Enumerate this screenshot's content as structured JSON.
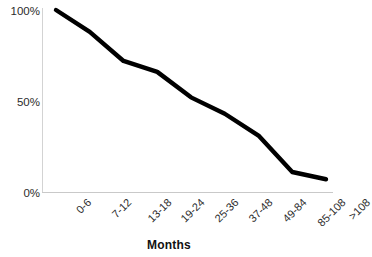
{
  "chart_data": {
    "type": "line",
    "title": "",
    "subtitle": "",
    "xlabel": "Months",
    "ylabel": "",
    "categories": [
      "0-6",
      "7-12",
      "13-18",
      "19-24",
      "25-36",
      "37-48",
      "49-84",
      "85-108",
      ">108"
    ],
    "values": [
      100,
      88,
      72,
      66,
      52,
      43,
      31,
      11,
      7
    ],
    "series": [
      {
        "name": "",
        "values": [
          100,
          88,
          72,
          66,
          52,
          43,
          31,
          11,
          7
        ]
      }
    ],
    "ylim": [
      0,
      100
    ],
    "y_ticks": [
      0,
      50,
      100
    ],
    "y_tick_labels": [
      "0%",
      "50%",
      "100%"
    ],
    "grid": false,
    "legend": false,
    "legend_position": "none",
    "line_color": "#000000",
    "axis_color": "#d0d0d0",
    "background": "#ffffff",
    "markers": false,
    "annotations": []
  },
  "axes": {
    "y_labels": [
      "100%",
      "50%",
      "0%"
    ],
    "x_labels": [
      "0-6",
      "7-12",
      "13-18",
      "19-24",
      "25-36",
      "37-48",
      "49-84",
      "85-108",
      ">108"
    ],
    "x_title": "Months"
  }
}
